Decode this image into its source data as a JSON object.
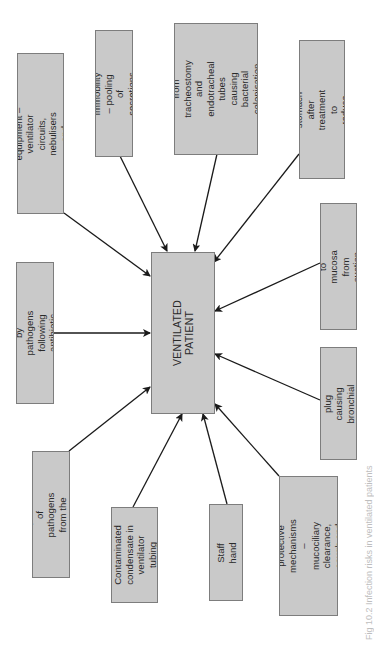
{
  "diagram": {
    "orientation": "rotated-90-ccw",
    "colors": {
      "box_fill": "#c9c9c9",
      "box_border": "#7d7d7d",
      "arrow": "#1a1a1a",
      "text": "#2a2a2a",
      "background": "#ffffff"
    },
    "center": {
      "label": "VENTILATED PATIENT"
    },
    "factors": [
      {
        "id": "contaminated-equipment",
        "label": "Contaminated\nequipment – ventilator circuits,\nnebulisers and humidifiers"
      },
      {
        "id": "immobility",
        "label": "Immobility – pooling\nof secretions"
      },
      {
        "id": "damage-irritation",
        "label": "Damage and irritation\nfrom tracheostomy\nand endotracheal tubes\ncausing bacterial\ncolonisation of the\noropharynx"
      },
      {
        "id": "stomach-pathogens",
        "label": "Pathogens from the\nstomach after treatment to\nreduce acid secretion"
      },
      {
        "id": "colonisation-antibiotic",
        "label": "Colonisation by pathogens\nfollowing antibiotic therapy"
      },
      {
        "id": "trauma-mucosa",
        "label": "Trauma to mucosa from\nsuction catheter"
      },
      {
        "id": "mucus-plug",
        "label": "Mucus plug causing\nbronchial occlusion"
      },
      {
        "id": "aspiration",
        "label": "Aspiration of pathogens\nfrom the oropharynx"
      },
      {
        "id": "contaminated-condensate",
        "label": "Contaminated\ncondensate in\nventilator tubing"
      },
      {
        "id": "staff-hand",
        "label": "Staff hand"
      },
      {
        "id": "loss-protective",
        "label": "Loss of normal protective\nmechanisms – mucociliary\nclearance, cough and\nsneeze reflex"
      }
    ],
    "caption": "Fig 10.2 Infection risks in ventilated patients"
  }
}
